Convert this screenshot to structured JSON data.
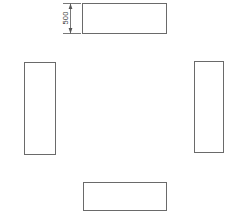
{
  "drawing": {
    "title": "Four Rectangle Layout Plan",
    "canvas": {
      "width": 234,
      "height": 222,
      "background": "#ffffff"
    },
    "style": {
      "stroke_color": "#6a6a6a",
      "stroke_width": 1,
      "fill_color": "#ffffff",
      "dimension_color": "#555555",
      "text_color": "#3a3a3a"
    },
    "shapes": [
      {
        "name": "top-rectangle",
        "x": 82,
        "y": 3,
        "width": 85,
        "height": 31
      },
      {
        "name": "left-rectangle",
        "x": 24,
        "y": 62,
        "width": 32,
        "height": 93
      },
      {
        "name": "right-rectangle",
        "x": 194,
        "y": 61,
        "width": 30,
        "height": 92
      },
      {
        "name": "bottom-rectangle",
        "x": 83,
        "y": 182,
        "width": 84,
        "height": 29
      }
    ],
    "dimension": {
      "label": "500",
      "orientation": "vertical",
      "line_x": 70,
      "start_y": 3,
      "end_y": 34,
      "text_x": 66,
      "text_y": 18,
      "extension_start_x": 62,
      "extension_end_x": 80
    }
  }
}
